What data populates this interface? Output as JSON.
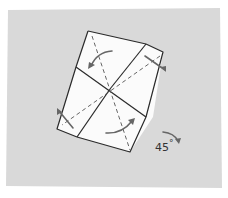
{
  "diagram": {
    "type": "origami-step",
    "background_color": "#d9d9d9",
    "paper_color": "#fbfbfb",
    "line_color": "#2a2a2a",
    "fold_line_color": "#555555",
    "arrow_color": "#666666",
    "rotation_label": "45°",
    "rotation_value": "45",
    "rotation_unit": "°"
  }
}
